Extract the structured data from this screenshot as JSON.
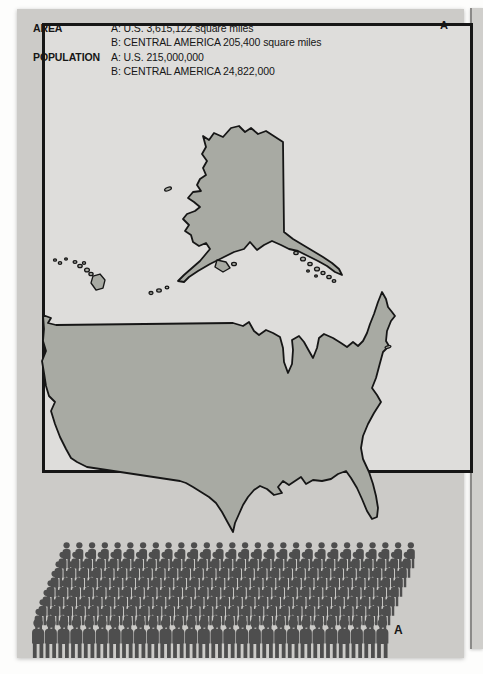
{
  "theme": {
    "page_bg": "#fdfdfc",
    "panel_bg": "#cccbc8",
    "box_bg": "#dedddb",
    "box_border": "#161616",
    "map_fill": "#a8aaa3",
    "map_stroke": "#161616",
    "figure_color": "#4e4e4e",
    "text_color": "#161616",
    "adjacent_page_bg": "#d0cfcc"
  },
  "legend": {
    "rows": [
      {
        "label": "AREA",
        "lines": [
          "A: U.S. 3,615,122 square miles",
          "B: CENTRAL AMERICA 205,400 square miles"
        ]
      },
      {
        "label": "POPULATION",
        "lines": [
          "A: U.S. 215,000,000",
          "B: CENTRAL AMERICA 24,822,000"
        ]
      }
    ]
  },
  "markers": {
    "panel_label": "A",
    "crowd_label": "A"
  },
  "chart_data": {
    "type": "pictorial-comparison",
    "title": "",
    "panel": "A",
    "measures": [
      {
        "measure": "AREA",
        "unit": "square miles",
        "items": [
          {
            "key": "A",
            "entity": "U.S.",
            "value": 3615122
          },
          {
            "key": "B",
            "entity": "CENTRAL AMERICA",
            "value": 205400
          }
        ]
      },
      {
        "measure": "POPULATION",
        "items": [
          {
            "key": "A",
            "entity": "U.S.",
            "value": 215000000
          },
          {
            "key": "B",
            "entity": "CENTRAL AMERICA",
            "value": 24822000
          }
        ]
      }
    ],
    "graphics": [
      {
        "kind": "map-silhouette",
        "label": "A",
        "entity": "U.S.",
        "regions": [
          "contiguous U.S.",
          "Alaska",
          "Hawaii"
        ]
      },
      {
        "kind": "crowd-pictogram",
        "label": "A",
        "entity": "U.S.",
        "rows": 9,
        "per_row": 28
      }
    ]
  }
}
